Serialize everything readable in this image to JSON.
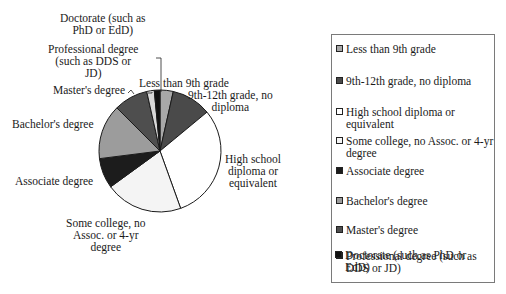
{
  "chart_data": {
    "type": "pie",
    "title": "",
    "categories": [
      "Less than 9th grade",
      "9th-12th grade, no diploma",
      "High school diploma or equivalent",
      "Some college, no Assoc. or 4-yr degree",
      "Associate degree",
      "Bachelor's degree",
      "Master's degree",
      "Professional degree (such as DDS or JD)",
      "Doctorate (such as PhD or EdD)"
    ],
    "values": [
      3.5,
      10.5,
      30.5,
      20.5,
      8.0,
      14.5,
      9.0,
      2.0,
      1.5
    ],
    "value_note": "approximate shares estimated from slice angles; no values printed on chart",
    "colors": [
      "#a8a8a8",
      "#4a4a4a",
      "#ffffff",
      "#f4f4f4",
      "#1c1c1c",
      "#9c9c9c",
      "#4e4e4e",
      "#d8d8d8",
      "#111111"
    ],
    "start_angle_deg": 0,
    "direction": "clockwise",
    "legend_position": "right"
  },
  "pie_labels": [
    {
      "lines": [
        "Less than 9th grade"
      ]
    },
    {
      "lines": [
        "9th-12th grade, no",
        "diploma"
      ]
    },
    {
      "lines": [
        "High school",
        "diploma or",
        "equivalent"
      ]
    },
    {
      "lines": [
        "Some college, no",
        "Assoc. or 4-yr",
        "degree"
      ]
    },
    {
      "lines": [
        "Associate degree"
      ]
    },
    {
      "lines": [
        "Bachelor's degree"
      ]
    },
    {
      "lines": [
        "Master's degree"
      ]
    },
    {
      "lines": [
        "Professional degree",
        "(such as DDS or",
        "JD)"
      ]
    },
    {
      "lines": [
        "Doctorate (such as",
        "PhD or EdD)"
      ]
    }
  ],
  "legend": {
    "items": [
      {
        "label": "Less than 9th grade"
      },
      {
        "label": "9th-12th grade, no diploma"
      },
      {
        "label": "High school diploma or equivalent"
      },
      {
        "label": "Some college, no Assoc. or 4-yr degree"
      },
      {
        "label": "Associate degree"
      },
      {
        "label": "Bachelor's degree"
      },
      {
        "label": "Master's degree"
      },
      {
        "label": "Professional degree (such as DDS or JD)"
      },
      {
        "label": "Doctorate (such as PhD or EdD)"
      }
    ]
  }
}
